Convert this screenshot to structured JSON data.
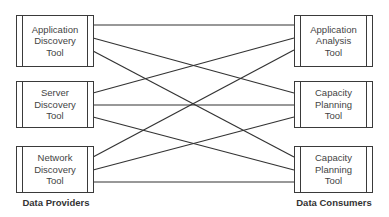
{
  "providers": {
    "caption": "Data Providers",
    "boxes": [
      {
        "label": "Application\nDiscovery\nTool"
      },
      {
        "label": "Server\nDiscovery\nTool"
      },
      {
        "label": "Network\nDiscovery\nTool"
      }
    ]
  },
  "consumers": {
    "caption": "Data Consumers",
    "boxes": [
      {
        "label": "Application\nAnalysis\nTool"
      },
      {
        "label": "Capacity\nPlanning\nTool"
      },
      {
        "label": "Capacity\nPlanning\nTool"
      }
    ]
  },
  "connections": [
    {
      "from": "Application Discovery Tool",
      "to": "Application Analysis Tool"
    },
    {
      "from": "Application Discovery Tool",
      "to": "Capacity Planning Tool (1)"
    },
    {
      "from": "Application Discovery Tool",
      "to": "Capacity Planning Tool (2)"
    },
    {
      "from": "Server Discovery Tool",
      "to": "Application Analysis Tool"
    },
    {
      "from": "Server Discovery Tool",
      "to": "Capacity Planning Tool (1)"
    },
    {
      "from": "Server Discovery Tool",
      "to": "Capacity Planning Tool (2)"
    },
    {
      "from": "Network Discovery Tool",
      "to": "Application Analysis Tool"
    },
    {
      "from": "Network Discovery Tool",
      "to": "Capacity Planning Tool (1)"
    },
    {
      "from": "Network Discovery Tool",
      "to": "Capacity Planning Tool (2)"
    }
  ],
  "colors": {
    "line": "#333333",
    "text": "#444444",
    "background": "#ffffff"
  }
}
